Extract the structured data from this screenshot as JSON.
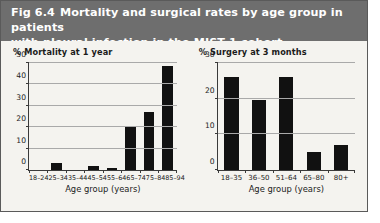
{
  "figure": {
    "number": "Fig 6.4",
    "title": "Mortality and surgical rates by age group in patients with pleural infection in the MIST 1 cohort",
    "title_line1": "Mortality and surgical rates by age group in patients",
    "title_line2": "with pleural infection in the MIST 1 cohort",
    "header_color": "#6e6e6e",
    "background_color": "#f4f3ef",
    "bar_color": "#111111"
  },
  "chart_data": [
    {
      "type": "bar",
      "title": "% Mortality at 1 year",
      "xlabel": "Age group (years)",
      "ylabel": "",
      "categories": [
        "18–24",
        "25–34",
        "35–44",
        "45–54",
        "55–64",
        "65–74",
        "75–84",
        "85–94"
      ],
      "values": [
        0,
        3.5,
        0,
        2,
        1,
        20,
        27,
        48.5
      ],
      "ylim": [
        0,
        50
      ],
      "yticks": [
        0,
        10,
        20,
        30,
        40,
        50
      ],
      "ytick_labels": [
        "0",
        "10",
        "20",
        "30",
        "40",
        "50"
      ],
      "grid": true,
      "legend": "none"
    },
    {
      "type": "bar",
      "title": "% Surgery at 3 months",
      "xlabel": "Age group (years)",
      "ylabel": "",
      "categories": [
        "18–35",
        "36–50",
        "51–64",
        "65–80",
        "80+"
      ],
      "values": [
        26,
        19.5,
        26,
        5,
        7
      ],
      "ylim": [
        0,
        30
      ],
      "yticks": [
        0,
        10,
        20,
        30
      ],
      "ytick_labels": [
        "0",
        "10",
        "20",
        "30"
      ],
      "grid": true,
      "legend": "none"
    }
  ]
}
